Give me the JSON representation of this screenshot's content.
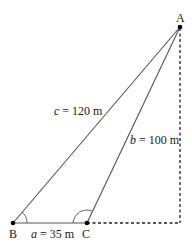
{
  "diagram": {
    "points": {
      "A": {
        "label": "A"
      },
      "B": {
        "label": "B"
      },
      "C": {
        "label": "C"
      }
    },
    "sides": {
      "a": {
        "var": "a",
        "text": " = 35 m"
      },
      "b": {
        "var": "b",
        "text": " = 100 m"
      },
      "c": {
        "var": "c",
        "text": " = 120 m"
      }
    },
    "colors": {
      "line": "#555555",
      "dashed": "#222222",
      "point": "#000000"
    }
  }
}
